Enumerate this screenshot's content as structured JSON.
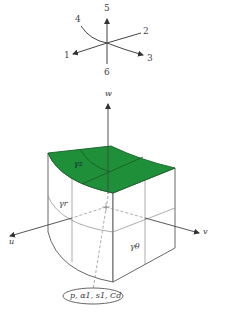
{
  "orientation_key": {
    "labels": [
      "1",
      "2",
      "3",
      "4",
      "5",
      "6"
    ]
  },
  "axes": {
    "w": "w",
    "u": "u",
    "v": "v"
  },
  "faces": {
    "top": "γz",
    "left": "γr",
    "right": "γθ"
  },
  "parameters_oval": "p, α1, s1, Cd",
  "colors": {
    "top_face": "#1f8f3a",
    "lines": "#555555",
    "dashed": "#888888"
  }
}
